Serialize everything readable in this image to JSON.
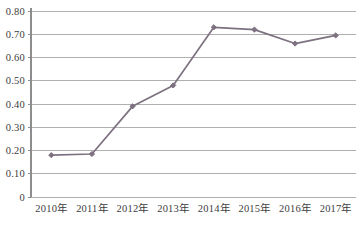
{
  "chart_data": {
    "type": "line",
    "title": "",
    "subtitle": "",
    "xlabel": "",
    "ylabel": "",
    "categories": [
      "2010年",
      "2011年",
      "2012年",
      "2013年",
      "2014年",
      "2015年",
      "2016年",
      "2017年"
    ],
    "series": [
      {
        "name": "",
        "values": [
          0.18,
          0.185,
          0.39,
          0.48,
          0.73,
          0.72,
          0.66,
          0.695
        ],
        "color": "#7d7180",
        "marker": "diamond"
      }
    ],
    "ylim": [
      0,
      0.8
    ],
    "ytick_values": [
      0,
      0.1,
      0.2,
      0.3,
      0.4,
      0.5,
      0.6,
      0.7,
      0.8
    ],
    "ytick_labels": [
      "0",
      "0.10",
      "0.20",
      "0.30",
      "0.40",
      "0.50",
      "0.60",
      "0.70",
      "0.80"
    ],
    "grid": "horizontal",
    "legend": "none",
    "background": "#ffffff",
    "gridline_color": "#a6a6a6",
    "axis_color": "#8d8d8d",
    "text_color": "#3d3d3d"
  },
  "plot_geometry": {
    "left": 31,
    "right": 356,
    "top": 11,
    "bottom": 197
  }
}
